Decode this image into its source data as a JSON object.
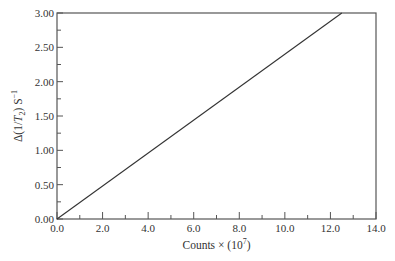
{
  "chart_data": {
    "type": "line",
    "title": "",
    "xlabel": "Counts × (10^7)",
    "ylabel": "Δ(1/T2) S^-1",
    "xlim": [
      0,
      14
    ],
    "ylim": [
      0,
      3
    ],
    "xticks": [
      "0.0",
      "2.0",
      "4.0",
      "6.0",
      "8.0",
      "10.0",
      "12.0",
      "14.0"
    ],
    "yticks": [
      "0.00",
      "0.50",
      "1.00",
      "1.50",
      "2.00",
      "2.50",
      "3.00"
    ],
    "grid": false,
    "series": [
      {
        "name": "linear fit",
        "x": [
          0.0,
          12.5
        ],
        "y": [
          0.0,
          3.0
        ],
        "color": "#333333"
      }
    ]
  },
  "labels": {
    "xlabel_main": "Counts × (10",
    "xlabel_exp": "7",
    "xlabel_end": ")",
    "ylabel_main": "Δ(1/",
    "ylabel_T": "T",
    "ylabel_sub": "2",
    "ylabel_end": ") S",
    "ylabel_exp": "−1"
  }
}
